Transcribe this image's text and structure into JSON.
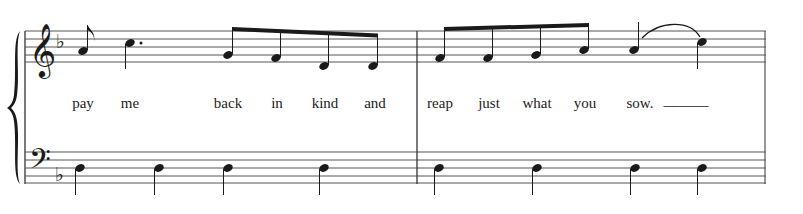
{
  "score": {
    "system": "grand-staff",
    "key_signature": "F major (1 flat)",
    "treble_clef": "treble-clef",
    "bass_clef": "bass-clef",
    "colors": {
      "ink": "#1a1a1a",
      "staff_line": "#555555",
      "background": "#ffffff"
    },
    "measures": [
      {
        "number": 1,
        "treble": [
          {
            "pitch": "A4",
            "duration": "eighth",
            "x": 83
          },
          {
            "pitch": "C5",
            "duration": "dotted-quarter",
            "x": 130
          },
          {
            "pitch": "G4",
            "duration": "eighth",
            "x": 228,
            "beamed": true
          },
          {
            "pitch": "F4",
            "duration": "eighth",
            "x": 276,
            "beamed": true
          },
          {
            "pitch": "D4",
            "duration": "eighth",
            "x": 324,
            "beamed": true
          },
          {
            "pitch": "D4",
            "duration": "eighth",
            "x": 373,
            "beamed": true
          }
        ],
        "bass": [
          {
            "pitch": "D3",
            "duration": "quarter",
            "x": 78
          },
          {
            "pitch": "D3",
            "duration": "quarter",
            "x": 155
          },
          {
            "pitch": "D3",
            "duration": "quarter",
            "x": 227
          },
          {
            "pitch": "D3",
            "duration": "quarter",
            "x": 323
          }
        ]
      },
      {
        "number": 2,
        "treble": [
          {
            "pitch": "F4",
            "duration": "eighth",
            "x": 440,
            "beamed": true
          },
          {
            "pitch": "F4",
            "duration": "eighth",
            "x": 488,
            "beamed": true
          },
          {
            "pitch": "G4",
            "duration": "eighth",
            "x": 536,
            "beamed": true
          },
          {
            "pitch": "A4",
            "duration": "eighth",
            "x": 584,
            "beamed": true
          },
          {
            "pitch": "A4",
            "duration": "quarter",
            "x": 634,
            "slur_start": true
          },
          {
            "pitch": "C5",
            "duration": "quarter",
            "x": 702,
            "slur_end": true
          }
        ],
        "bass": [
          {
            "pitch": "D3",
            "duration": "quarter",
            "x": 440
          },
          {
            "pitch": "D3",
            "duration": "quarter",
            "x": 537
          },
          {
            "pitch": "D3",
            "duration": "quarter",
            "x": 635
          },
          {
            "pitch": "D3",
            "duration": "quarter",
            "x": 701
          }
        ]
      }
    ],
    "lyrics": [
      {
        "text": "pay",
        "x": 83
      },
      {
        "text": "me",
        "x": 130
      },
      {
        "text": "back",
        "x": 228
      },
      {
        "text": "in",
        "x": 276
      },
      {
        "text": "kind",
        "x": 324
      },
      {
        "text": "and",
        "x": 375
      },
      {
        "text": "reap",
        "x": 442
      },
      {
        "text": "just",
        "x": 490
      },
      {
        "text": "what",
        "x": 537
      },
      {
        "text": "you",
        "x": 585
      },
      {
        "text": "sow.",
        "x": 640
      },
      {
        "text": "______",
        "x": 686
      }
    ]
  }
}
